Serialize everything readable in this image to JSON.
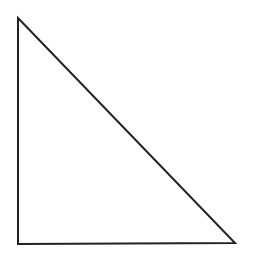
{
  "diagram": {
    "shape": "right-triangle",
    "stroke_color": "#222222",
    "fill_color": "#ffffff",
    "background": "#ffffff",
    "stroke_width": 2,
    "vertices": [
      {
        "name": "top",
        "x": 18,
        "y": 18
      },
      {
        "name": "bottom-left",
        "x": 18,
        "y": 244
      },
      {
        "name": "bottom-right",
        "x": 235,
        "y": 243
      }
    ]
  }
}
